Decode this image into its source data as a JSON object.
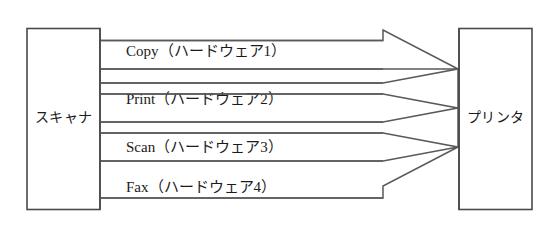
{
  "diagram": {
    "type": "block-flow",
    "title": "",
    "nodes": [
      {
        "id": "scanner",
        "label": "スキャナ",
        "role": "source-device"
      },
      {
        "id": "printer",
        "label": "プリンタ",
        "role": "target-device"
      }
    ],
    "flows": [
      {
        "id": "copy",
        "label": "Copy（ハードウェア1）",
        "name": "Copy",
        "hardware": "ハードウェア1",
        "direction": "right"
      },
      {
        "id": "print",
        "label": "Print（ハードウェア2）",
        "name": "Print",
        "hardware": "ハードウェア2",
        "direction": "left"
      },
      {
        "id": "scan",
        "label": "Scan（ハードウェア3）",
        "name": "Scan",
        "hardware": "ハードウェア3",
        "direction": "left"
      },
      {
        "id": "fax",
        "label": "Fax（ハードウェア4）",
        "name": "Fax",
        "hardware": "ハードウェア4",
        "direction": "right"
      }
    ],
    "colors": {
      "background": "#ffffff",
      "stroke": "#4a4a4a",
      "band_stroke": "#5a5a5a",
      "text": "#1b1b1b"
    }
  }
}
